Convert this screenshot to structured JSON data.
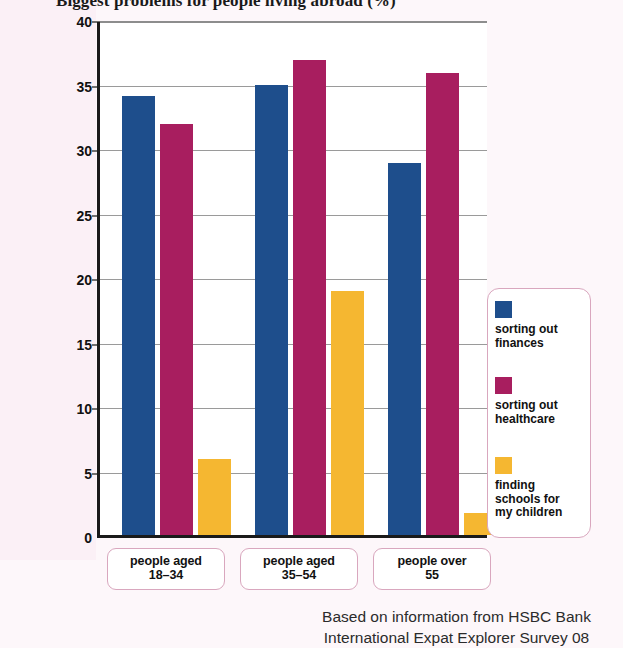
{
  "title": "Biggest problems for people living abroad (%)",
  "source_note": "Based on information from HSBC Bank\nInternational Expat Explorer Survey 08",
  "colors": {
    "series_finances": "#1e4e8c",
    "series_healthcare": "#a81e5f",
    "series_schools": "#f5b731",
    "box_border": "#d9a7be",
    "axis": "#1a1a1a",
    "gridline": "#9a9a9a",
    "paper": "#faeef4"
  },
  "legend": {
    "items": [
      {
        "label": "sorting out\nfinances",
        "color": "#1e4e8c"
      },
      {
        "label": "sorting out\nhealthcare",
        "color": "#a81e5f"
      },
      {
        "label": "finding\nschools for\nmy children",
        "color": "#f5b731"
      }
    ]
  },
  "chart_data": {
    "type": "bar",
    "title": "Biggest problems for people living abroad (%)",
    "xlabel": "",
    "ylabel": "",
    "ylim": [
      0,
      40
    ],
    "yticks": [
      0,
      5,
      10,
      15,
      20,
      25,
      30,
      35,
      40
    ],
    "grid": true,
    "legend_position": "right",
    "categories": [
      "people aged\n18–34",
      "people aged\n35–54",
      "people over\n55"
    ],
    "series": [
      {
        "name": "sorting out finances",
        "color": "#1e4e8c",
        "values": [
          34.0,
          34.9,
          28.8
        ]
      },
      {
        "name": "sorting out healthcare",
        "color": "#a81e5f",
        "values": [
          31.9,
          36.8,
          35.8
        ]
      },
      {
        "name": "finding schools for my children",
        "color": "#f5b731",
        "values": [
          5.9,
          18.9,
          1.7
        ]
      }
    ],
    "annotation": "Based on information from HSBC Bank International Expat Explorer Survey 08"
  }
}
